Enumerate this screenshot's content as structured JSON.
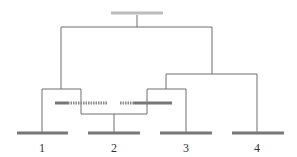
{
  "diagram": {
    "type": "tree",
    "colors": {
      "line": "#6e6e6e",
      "bar": "#777777",
      "root_bar": "#bcbcbc"
    },
    "root": {
      "label": ""
    },
    "leaves": [
      {
        "id": "1",
        "label": "1"
      },
      {
        "id": "2",
        "label": "2"
      },
      {
        "id": "3",
        "label": "3"
      },
      {
        "id": "4",
        "label": "4"
      }
    ],
    "intermediate": {
      "left_dashed_bar": "solid-then-dotted",
      "right_dashed_bar": "dotted-then-solid"
    }
  }
}
